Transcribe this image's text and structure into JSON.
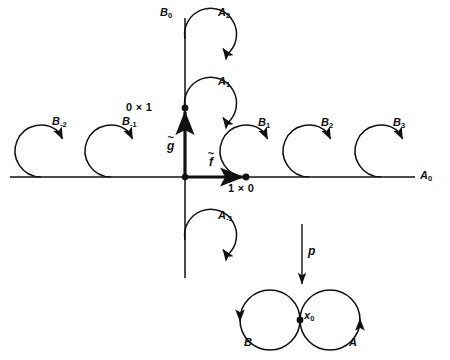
{
  "figure": {
    "colors": {
      "ink": "#111111",
      "background": "#ffffff"
    },
    "axes": {
      "horizontal_label": "A0",
      "horizontal_label_sub": "0",
      "horizontal_label_base": "A",
      "vertical_label_base": "B",
      "vertical_label_sub": "0"
    },
    "origin_vectors": [
      {
        "name": "f-tilde",
        "base": "f",
        "accent": "~",
        "direction": "right"
      },
      {
        "name": "g-tilde",
        "base": "g",
        "accent": "~",
        "direction": "up"
      }
    ],
    "marked_points": [
      {
        "label": "0 × 1",
        "at": "vertical-axis",
        "x": 185,
        "y": 108
      },
      {
        "label": "1 × 0",
        "at": "horizontal-axis",
        "x": 246,
        "y": 177
      }
    ],
    "horizontal_circles": [
      {
        "label_base": "B",
        "label_sub": "-2",
        "cx": 41,
        "cy": 151,
        "r": 26
      },
      {
        "label_base": "B",
        "label_sub": "-1",
        "cx": 111,
        "cy": 151,
        "r": 26
      },
      {
        "label_base": "B",
        "label_sub": "1",
        "cx": 246,
        "cy": 151,
        "r": 26
      },
      {
        "label_base": "B",
        "label_sub": "2",
        "cx": 309,
        "cy": 151,
        "r": 26
      },
      {
        "label_base": "B",
        "label_sub": "3",
        "cx": 381,
        "cy": 151,
        "r": 26
      }
    ],
    "vertical_circles": [
      {
        "label_base": "A",
        "label_sub": "2",
        "cx": 209,
        "cy": 39,
        "r": 26
      },
      {
        "label_base": "A",
        "label_sub": "1",
        "cx": 209,
        "cy": 108,
        "r": 26
      },
      {
        "label_base": "A",
        "label_sub": "-1",
        "cx": 209,
        "cy": 240,
        "r": 26
      }
    ],
    "projection": {
      "label": "p",
      "direction": "down"
    },
    "base_space": {
      "basepoint_label": "x0",
      "basepoint_base": "x",
      "basepoint_sub": "0",
      "left_loop_label": "B",
      "right_loop_label": "A",
      "left_circle": {
        "cx": 270,
        "cy": 320,
        "r": 30
      },
      "right_circle": {
        "cx": 330,
        "cy": 320,
        "r": 30
      }
    }
  }
}
